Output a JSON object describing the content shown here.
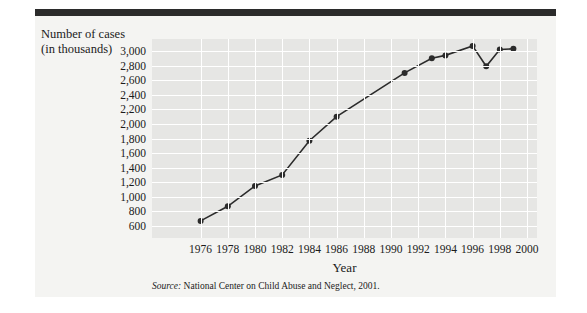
{
  "figure": {
    "y_axis_title": "Number of cases (in thousands)",
    "x_axis_title": "Year",
    "source_prefix": "Source:",
    "source_text": "National Center on Child Abuse and Neglect, 2001."
  },
  "colors": {
    "header_bar": "#2b2b2b",
    "figure_bg": "#f4f4f2",
    "plot_bg": "#e6e6e4",
    "gridline": "#ffffff",
    "line": "#2b2b2b",
    "marker": "#2b2b2b",
    "text": "#1b1b1b"
  },
  "chart_data": {
    "type": "line",
    "title": "",
    "xlabel": "Year",
    "ylabel": "Number of cases (in thousands)",
    "xlim": [
      1975,
      2000
    ],
    "ylim": [
      600,
      3000
    ],
    "ytick_labels": [
      "3,000",
      "2,800",
      "2,600",
      "2,400",
      "2,200",
      "2,000",
      "1,800",
      "1,600",
      "1,400",
      "1,200",
      "1,000",
      "800",
      "600"
    ],
    "ytick_values": [
      3000,
      2800,
      2600,
      2400,
      2200,
      2000,
      1800,
      1600,
      1400,
      1200,
      1000,
      800,
      600
    ],
    "xtick_labels": [
      "1976",
      "1978",
      "1980",
      "1982",
      "1984",
      "1986",
      "1988",
      "1990",
      "1992",
      "1994",
      "1996",
      "1998",
      "2000"
    ],
    "xtick_values": [
      1976,
      1978,
      1980,
      1982,
      1984,
      1986,
      1988,
      1990,
      1992,
      1994,
      1996,
      1998,
      2000
    ],
    "grid": true,
    "legend": "none",
    "x": [
      1976,
      1978,
      1980,
      1982,
      1984,
      1986,
      1991,
      1993,
      1994,
      1996,
      1997,
      1998,
      1999
    ],
    "values": [
      670,
      870,
      1150,
      1300,
      1770,
      2100,
      2700,
      2900,
      2940,
      3070,
      2790,
      3020,
      3030
    ],
    "series": [
      {
        "name": "Reported cases of child abuse and neglect",
        "points": [
          {
            "year": 1976,
            "value": 670
          },
          {
            "year": 1978,
            "value": 870
          },
          {
            "year": 1980,
            "value": 1150
          },
          {
            "year": 1982,
            "value": 1300
          },
          {
            "year": 1984,
            "value": 1770
          },
          {
            "year": 1986,
            "value": 2100
          },
          {
            "year": 1991,
            "value": 2700
          },
          {
            "year": 1993,
            "value": 2900
          },
          {
            "year": 1994,
            "value": 2940
          },
          {
            "year": 1996,
            "value": 3070
          },
          {
            "year": 1997,
            "value": 2790
          },
          {
            "year": 1998,
            "value": 3020
          },
          {
            "year": 1999,
            "value": 3030
          }
        ]
      }
    ]
  }
}
